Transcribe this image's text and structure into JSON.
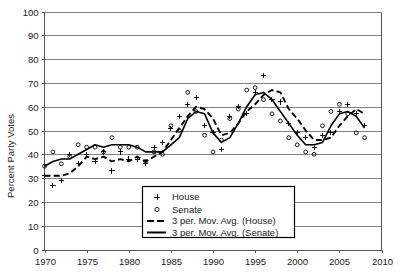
{
  "chart_data": {
    "type": "scatter",
    "title": "",
    "xlabel": "",
    "ylabel": "Percent Party Votes",
    "xlim": [
      1970,
      2010
    ],
    "ylim": [
      0,
      100
    ],
    "grid": true,
    "legend_position": "bottom-center",
    "xticks": [
      "1970",
      "1975",
      "1980",
      "1985",
      "1990",
      "1995",
      "2000",
      "2005",
      "2010"
    ],
    "yticks": [
      "0",
      "10",
      "20",
      "30",
      "40",
      "50",
      "60",
      "70",
      "80",
      "90",
      "100"
    ],
    "series": [
      {
        "name": "House",
        "marker": "plus",
        "style": "points",
        "x": [
          1970,
          1971,
          1972,
          1973,
          1974,
          1975,
          1976,
          1977,
          1978,
          1979,
          1980,
          1981,
          1982,
          1983,
          1984,
          1985,
          1986,
          1987,
          1988,
          1989,
          1990,
          1991,
          1992,
          1993,
          1994,
          1995,
          1996,
          1997,
          1998,
          1999,
          2000,
          2001,
          2002,
          2003,
          2004,
          2005,
          2006,
          2007,
          2008
        ],
        "values": [
          31,
          27,
          29,
          40,
          36,
          40,
          37,
          41,
          33,
          41,
          38,
          38,
          36,
          43,
          45,
          51,
          56,
          61,
          64,
          52,
          49,
          42,
          56,
          60,
          57,
          66,
          73,
          63,
          62,
          53,
          49,
          47,
          43,
          48,
          49,
          58,
          61,
          57,
          52
        ]
      },
      {
        "name": "Senate",
        "marker": "circle",
        "style": "points",
        "x": [
          1970,
          1971,
          1972,
          1973,
          1974,
          1975,
          1976,
          1977,
          1978,
          1979,
          1980,
          1981,
          1982,
          1983,
          1984,
          1985,
          1986,
          1987,
          1988,
          1989,
          1990,
          1991,
          1992,
          1993,
          1994,
          1995,
          1996,
          1997,
          1998,
          1999,
          2000,
          2001,
          2002,
          2003,
          2004,
          2005,
          2006,
          2007,
          2008
        ],
        "values": [
          35,
          41,
          36,
          39,
          44,
          43,
          43,
          41,
          47,
          43,
          43,
          43,
          37,
          41,
          40,
          52,
          50,
          66,
          58,
          48,
          41,
          46,
          55,
          59,
          67,
          68,
          63,
          57,
          54,
          47,
          44,
          41,
          40,
          52,
          58,
          61,
          57,
          49,
          47
        ]
      },
      {
        "name": "3 per. Mov. Avg. (House)",
        "marker": "none",
        "style": "dashed-line",
        "x": [
          1970,
          1971,
          1972,
          1973,
          1974,
          1975,
          1976,
          1977,
          1978,
          1979,
          1980,
          1981,
          1982,
          1983,
          1984,
          1985,
          1986,
          1987,
          1988,
          1989,
          1990,
          1991,
          1992,
          1993,
          1994,
          1995,
          1996,
          1997,
          1998,
          1999,
          2000,
          2001,
          2002,
          2003,
          2004,
          2005,
          2006,
          2007,
          2008
        ],
        "values": [
          31,
          31,
          31,
          32,
          35,
          39,
          38,
          39,
          37,
          38,
          37,
          39,
          37,
          39,
          41,
          46,
          51,
          56,
          60,
          59,
          55,
          48,
          49,
          53,
          58,
          61,
          65,
          67,
          66,
          59,
          55,
          50,
          46,
          46,
          47,
          52,
          56,
          59,
          57
        ]
      },
      {
        "name": "3 per. Mov. Avg. (Senate)",
        "marker": "none",
        "style": "solid-line",
        "x": [
          1970,
          1971,
          1972,
          1973,
          1974,
          1975,
          1976,
          1977,
          1978,
          1979,
          1980,
          1981,
          1982,
          1983,
          1984,
          1985,
          1986,
          1987,
          1988,
          1989,
          1990,
          1991,
          1992,
          1993,
          1994,
          1995,
          1996,
          1997,
          1998,
          1999,
          2000,
          2001,
          2002,
          2003,
          2004,
          2005,
          2006,
          2007,
          2008
        ],
        "values": [
          35,
          37,
          38,
          38,
          40,
          42,
          44,
          43,
          44,
          44,
          44,
          43,
          41,
          41,
          41,
          44,
          47,
          55,
          58,
          57,
          49,
          45,
          47,
          53,
          60,
          65,
          66,
          63,
          58,
          53,
          48,
          44,
          44,
          45,
          52,
          57,
          58,
          56,
          51
        ]
      }
    ]
  },
  "legend": {
    "items": [
      {
        "label": "House",
        "glyph": "plus-marker"
      },
      {
        "label": "Senate",
        "glyph": "circle-marker"
      },
      {
        "label": "3 per. Mov. Avg. (House)",
        "glyph": "dashed-line-swatch"
      },
      {
        "label": "3 per. Mov. Avg. (Senate)",
        "glyph": "solid-line-swatch"
      }
    ]
  }
}
